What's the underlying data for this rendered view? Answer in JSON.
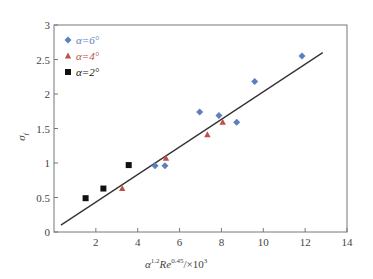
{
  "chart_data": {
    "type": "scatter",
    "title": "",
    "xlabel": "α^1.2 Re^0.45 / ×10^3",
    "ylabel": "σ_f",
    "xlim": [
      0,
      14
    ],
    "ylim": [
      0,
      3
    ],
    "x_ticks": [
      2,
      4,
      6,
      8,
      10,
      12,
      14
    ],
    "y_ticks": [
      0,
      0.5,
      1,
      1.5,
      2,
      2.5,
      3
    ],
    "x_tick_labels": [
      "2",
      "4",
      "6",
      "8",
      "10",
      "12",
      "14"
    ],
    "y_tick_labels": [
      "0",
      "0.5",
      "1",
      "1.5",
      "2",
      "2.5",
      "3"
    ],
    "grid": false,
    "legend_position": "upper-left",
    "series": [
      {
        "name": "α=6°",
        "marker": "diamond",
        "color": "#5b7fbf",
        "points": [
          [
            4.83,
            0.96
          ],
          [
            5.3,
            0.96
          ],
          [
            6.96,
            1.74
          ],
          [
            7.88,
            1.69
          ],
          [
            8.73,
            1.59
          ],
          [
            9.59,
            2.18
          ],
          [
            11.85,
            2.55
          ]
        ]
      },
      {
        "name": "α=4°",
        "marker": "triangle",
        "color": "#c0504d",
        "points": [
          [
            3.26,
            0.63
          ],
          [
            5.35,
            1.07
          ],
          [
            7.33,
            1.41
          ],
          [
            8.06,
            1.59
          ]
        ]
      },
      {
        "name": "α=2°",
        "marker": "square",
        "color": "#111111",
        "points": [
          [
            1.51,
            0.49
          ],
          [
            2.36,
            0.63
          ],
          [
            3.57,
            0.97
          ]
        ]
      }
    ],
    "fit_line": {
      "name": "linear fit",
      "color": "#333333",
      "x": [
        0.33,
        12.84
      ],
      "y": [
        0.1,
        2.6
      ]
    }
  },
  "legend": {
    "items": [
      {
        "label": "α=6°",
        "color": "#5b7fbf"
      },
      {
        "label": "α=4°",
        "color": "#c0504d"
      },
      {
        "label": "α=2°",
        "color": "#111111"
      }
    ]
  },
  "axes": {
    "x_title_main": "α",
    "x_title_sup1": "1.2",
    "x_title_re": "Re",
    "x_title_sup2": "0.45",
    "x_title_tail": "/×10",
    "x_title_sup3": "3",
    "y_title_main": "σ",
    "y_title_sub": "f"
  }
}
